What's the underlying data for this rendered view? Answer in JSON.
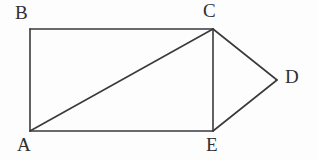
{
  "figure": {
    "background_color": "#fdfdfd",
    "stroke_color": "#3a3a3c",
    "label_color": "#2f2f31",
    "stroke_width": 1.6,
    "width": 318,
    "height": 160,
    "vertices": [
      {
        "id": "A",
        "label": "A",
        "x": 30,
        "y": 131
      },
      {
        "id": "B",
        "label": "B",
        "x": 30,
        "y": 29
      },
      {
        "id": "C",
        "label": "C",
        "x": 213,
        "y": 29
      },
      {
        "id": "D",
        "label": "D",
        "x": 277,
        "y": 80
      },
      {
        "id": "E",
        "label": "E",
        "x": 213,
        "y": 131
      }
    ],
    "edges": [
      {
        "id": "AB",
        "name": "rectangle-left-side",
        "from": "A",
        "to": "B",
        "x1": 30,
        "y1": 131,
        "x2": 30,
        "y2": 29
      },
      {
        "id": "BC",
        "name": "rectangle-top-side",
        "from": "B",
        "to": "C",
        "x1": 30,
        "y1": 29,
        "x2": 213,
        "y2": 29
      },
      {
        "id": "CE",
        "name": "rectangle-right-side",
        "from": "C",
        "to": "E",
        "x1": 213,
        "y1": 29,
        "x2": 213,
        "y2": 131
      },
      {
        "id": "AE",
        "name": "rectangle-bottom-side",
        "from": "A",
        "to": "E",
        "x1": 30,
        "y1": 131,
        "x2": 213,
        "y2": 131
      },
      {
        "id": "AC",
        "name": "rectangle-diagonal",
        "from": "A",
        "to": "C",
        "x1": 30,
        "y1": 131,
        "x2": 213,
        "y2": 29
      },
      {
        "id": "CD",
        "name": "triangle-upper-side",
        "from": "C",
        "to": "D",
        "x1": 213,
        "y1": 29,
        "x2": 277,
        "y2": 80
      },
      {
        "id": "ED",
        "name": "triangle-lower-side",
        "from": "E",
        "to": "D",
        "x1": 213,
        "y1": 131,
        "x2": 277,
        "y2": 80
      }
    ],
    "labels": {
      "A": "A",
      "B": "B",
      "C": "C",
      "D": "D",
      "E": "E"
    }
  }
}
